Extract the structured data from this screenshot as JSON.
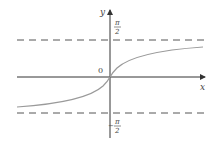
{
  "diagram": {
    "function": "y = arctan x",
    "axes": {
      "x_label": "x",
      "y_label": "y",
      "origin_label": "0"
    },
    "asymptotes": [
      {
        "label_num": "π",
        "label_den": "2",
        "sign": "",
        "value": "π/2"
      },
      {
        "label_num": "π",
        "label_den": "2",
        "sign": "−",
        "value": "−π/2"
      }
    ],
    "colors": {
      "axis": "#333333",
      "curve": "#9a9a9a",
      "dash": "#555555"
    }
  }
}
